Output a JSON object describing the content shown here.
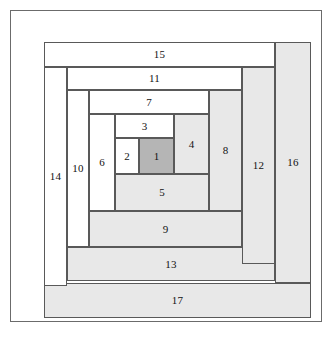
{
  "figure": {
    "frame": {
      "border_color": "#6b6b6b",
      "background": "#ffffff"
    }
  },
  "colors": {
    "light": "#ffffff",
    "medium": "#e8e8e8",
    "dark": "#b5b5b5",
    "outline": "#595959",
    "frame": "#6b6b6b",
    "label": "#121212"
  },
  "block": {
    "x": 33,
    "y": 31,
    "width": 267,
    "height": 276,
    "pieces": [
      {
        "label": "1",
        "x": 95,
        "y": 96,
        "w": 35,
        "h": 36,
        "shade": "dark"
      },
      {
        "label": "2",
        "x": 71,
        "y": 96,
        "w": 24,
        "h": 36,
        "shade": "light"
      },
      {
        "label": "3",
        "x": 71,
        "y": 72,
        "w": 59,
        "h": 24,
        "shade": "light"
      },
      {
        "label": "4",
        "x": 130,
        "y": 72,
        "w": 35,
        "h": 60,
        "shade": "medium"
      },
      {
        "label": "5",
        "x": 71,
        "y": 132,
        "w": 94,
        "h": 37,
        "shade": "medium"
      },
      {
        "label": "6",
        "x": 45,
        "y": 72,
        "w": 26,
        "h": 97,
        "shade": "light"
      },
      {
        "label": "7",
        "x": 45,
        "y": 48,
        "w": 120,
        "h": 24,
        "shade": "light"
      },
      {
        "label": "8",
        "x": 165,
        "y": 48,
        "w": 33,
        "h": 121,
        "shade": "medium"
      },
      {
        "label": "9",
        "x": 45,
        "y": 169,
        "w": 153,
        "h": 36,
        "shade": "medium"
      },
      {
        "label": "10",
        "x": 23,
        "y": 48,
        "w": 22,
        "h": 157,
        "shade": "light"
      },
      {
        "label": "11",
        "x": 23,
        "y": 25,
        "w": 175,
        "h": 23,
        "shade": "light"
      },
      {
        "label": "12",
        "x": 198,
        "y": 25,
        "w": 33,
        "h": 197,
        "shade": "medium"
      },
      {
        "label": "13",
        "x": 23,
        "y": 205,
        "w": 208,
        "h": 34,
        "shade": "medium"
      },
      {
        "label": "14",
        "x": 0,
        "y": 25,
        "w": 23,
        "h": 219,
        "shade": "light"
      },
      {
        "label": "15",
        "x": 0,
        "y": 0,
        "w": 231,
        "h": 25,
        "shade": "light"
      },
      {
        "label": "16",
        "x": 231,
        "y": 0,
        "w": 36,
        "h": 241,
        "shade": "medium"
      },
      {
        "label": "17",
        "x": 0,
        "y": 241,
        "w": 267,
        "h": 35,
        "shade": "medium"
      }
    ]
  }
}
